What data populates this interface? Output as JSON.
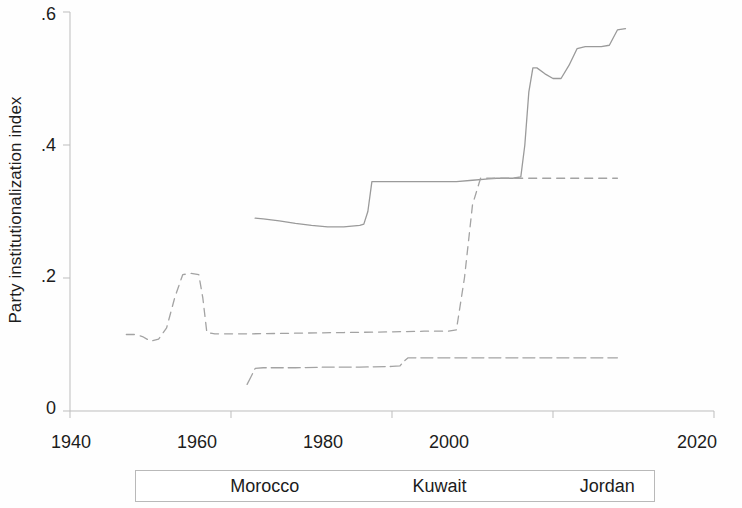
{
  "chart_data": {
    "type": "line",
    "title": "",
    "xlabel": "",
    "ylabel": "Party institutionalization index",
    "xlim": [
      1940,
      2020
    ],
    "ylim": [
      0,
      0.6
    ],
    "xticks": [
      1940,
      1960,
      1980,
      2000,
      2020
    ],
    "xtick_labels": [
      "1940",
      "1960",
      "1980",
      "2000",
      "2020"
    ],
    "yticks": [
      0,
      0.2,
      0.4,
      0.6
    ],
    "ytick_labels": [
      "0",
      ".2",
      ".4",
      ".6"
    ],
    "grid": false,
    "legend_position": "below-axes",
    "series": [
      {
        "name": "Morocco",
        "style": "solid",
        "color": "#9a9a9a",
        "x": [
          1963,
          1964,
          1966,
          1968,
          1970,
          1972,
          1974,
          1976,
          1976.5,
          1977,
          1977.5,
          1980,
          1984,
          1988,
          1990,
          1992,
          1993,
          1995,
          1996,
          1996.5,
          1997,
          1997.5,
          1998,
          1999,
          2000,
          2001,
          2002,
          2003,
          2004,
          2005,
          2006,
          2007,
          2008,
          2009
        ],
        "y": [
          0.29,
          0.289,
          0.286,
          0.282,
          0.279,
          0.277,
          0.277,
          0.279,
          0.281,
          0.3,
          0.345,
          0.345,
          0.345,
          0.345,
          0.347,
          0.349,
          0.35,
          0.35,
          0.352,
          0.4,
          0.48,
          0.516,
          0.516,
          0.507,
          0.5,
          0.5,
          0.52,
          0.545,
          0.548,
          0.548,
          0.548,
          0.55,
          0.573,
          0.575
        ]
      },
      {
        "name": "Kuwait",
        "style": "dashed",
        "color": "#a3a3a3",
        "x": [
          1947,
          1948,
          1949,
          1950,
          1951,
          1952,
          1953,
          1954,
          1955,
          1956,
          1956.5,
          1957,
          1958,
          1962,
          1968,
          1974,
          1980,
          1984,
          1987,
          1988,
          1989,
          1990,
          1991,
          1995,
          2000,
          2005,
          2008
        ],
        "y": [
          0.115,
          0.115,
          0.112,
          0.105,
          0.108,
          0.125,
          0.17,
          0.205,
          0.207,
          0.205,
          0.17,
          0.118,
          0.116,
          0.116,
          0.117,
          0.118,
          0.119,
          0.12,
          0.12,
          0.122,
          0.2,
          0.31,
          0.35,
          0.35,
          0.35,
          0.35,
          0.35
        ]
      },
      {
        "name": "Jordan",
        "style": "dash-dot",
        "color": "#a3a3a3",
        "x": [
          1962,
          1962.5,
          1963,
          1964,
          1968,
          1972,
          1976,
          1980,
          1981,
          1981.5,
          1982,
          1986,
          1990,
          1995,
          2000,
          2005,
          2008
        ],
        "y": [
          0.04,
          0.052,
          0.064,
          0.065,
          0.065,
          0.066,
          0.066,
          0.067,
          0.068,
          0.075,
          0.08,
          0.08,
          0.08,
          0.08,
          0.08,
          0.08,
          0.08
        ]
      }
    ]
  },
  "axes": {
    "y_title": "Party institutionalization index"
  },
  "legend": {
    "items": [
      {
        "label": "Morocco",
        "key": "legend-line-solid"
      },
      {
        "label": "Kuwait",
        "key": "legend-line-dashed"
      },
      {
        "label": "Jordan",
        "key": "legend-line-dashdot"
      }
    ]
  }
}
